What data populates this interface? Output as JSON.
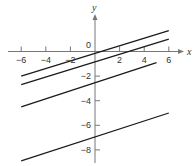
{
  "chart_data": {
    "type": "line",
    "title": "",
    "xlabel": "x",
    "ylabel": "y",
    "xlim": [
      -6.5,
      7
    ],
    "ylim": [
      -9.3,
      3.2
    ],
    "grid": false,
    "legend": null,
    "x_ticks": [
      -6,
      -4,
      -2,
      2,
      4,
      6
    ],
    "x_tick_labels": [
      "-6",
      "-4",
      "-2",
      "2",
      "4",
      "6"
    ],
    "y_ticks": [
      -2,
      -4,
      -6,
      -8
    ],
    "y_tick_labels": [
      "-2",
      "-4",
      "-6",
      "-8"
    ],
    "origin_label": "0",
    "series": [
      {
        "name": "line-1",
        "x": [
          -6,
          6
        ],
        "y": [
          -2.0,
          1.7
        ]
      },
      {
        "name": "line-2",
        "x": [
          -6,
          6
        ],
        "y": [
          -2.7,
          1.0
        ]
      },
      {
        "name": "line-3",
        "x": [
          -6,
          5
        ],
        "y": [
          -4.5,
          -0.9
        ]
      },
      {
        "name": "line-4",
        "x": [
          -6,
          6
        ],
        "y": [
          -8.9,
          -5.0
        ]
      }
    ]
  },
  "colors": {
    "line": "#1a1a1a",
    "axis": "#777777",
    "text": "#333333"
  }
}
